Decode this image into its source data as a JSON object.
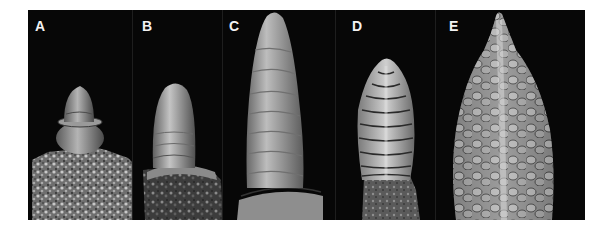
{
  "figure": {
    "background_color": "#ffffff",
    "panel_background_color": "#050505",
    "label_color": "#f2f2f2",
    "panels": [
      {
        "label": "A",
        "subject": "short-conical-apex-on-rough-stem"
      },
      {
        "label": "B",
        "subject": "elongated-dome-apex"
      },
      {
        "label": "C",
        "subject": "tall-ringed-apex"
      },
      {
        "label": "D",
        "subject": "apex-with-paired-lateral-primordia"
      },
      {
        "label": "E",
        "subject": "spike-with-many-branched-primordia"
      }
    ]
  }
}
